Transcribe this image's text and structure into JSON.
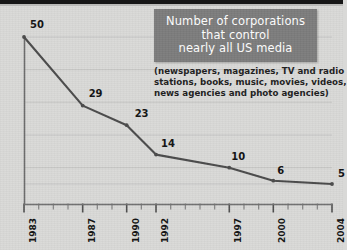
{
  "title": {
    "lines": [
      "Number of corporations",
      "that control",
      "nearly all US media"
    ],
    "box_color": "#7c7c7c",
    "text_color": "#ffffff"
  },
  "subtitle": {
    "lines": [
      "(newspapers, magazines, TV and radio",
      "stations, books, music, movies, videos,",
      "news agencies and photo agencies)"
    ]
  },
  "chart_data": {
    "type": "line",
    "title": "Number of corporations that control nearly all US media",
    "subtitle": "(newspapers, magazines, TV and radio stations, books, music, movies, videos, news agencies and photo agencies)",
    "xlabel": "",
    "ylabel": "",
    "x": [
      1983,
      1987,
      1990,
      1992,
      1997,
      2000,
      2004
    ],
    "values": [
      50,
      29,
      23,
      14,
      10,
      6,
      5
    ],
    "point_labels": [
      "50",
      "29",
      "23",
      "14",
      "10",
      "6",
      "5"
    ],
    "tick_labels": [
      "1983",
      "1987",
      "1990",
      "1992",
      "1997",
      "2000",
      "2004"
    ],
    "xlim": [
      1983,
      2004
    ],
    "ylim": [
      0,
      50
    ],
    "axis_tick_years": [
      1983,
      1984,
      1985,
      1986,
      1987,
      1988,
      1989,
      1990,
      1991,
      1992,
      1993,
      1994,
      1995,
      1996,
      1997,
      1998,
      1999,
      2000,
      2001,
      2002,
      2003,
      2004
    ],
    "grid": "faint-horizontal",
    "legend": "none",
    "line_color": "#4a4a4a",
    "axis_color": "#6e6e6e",
    "background_color": "#d9d9d7"
  }
}
